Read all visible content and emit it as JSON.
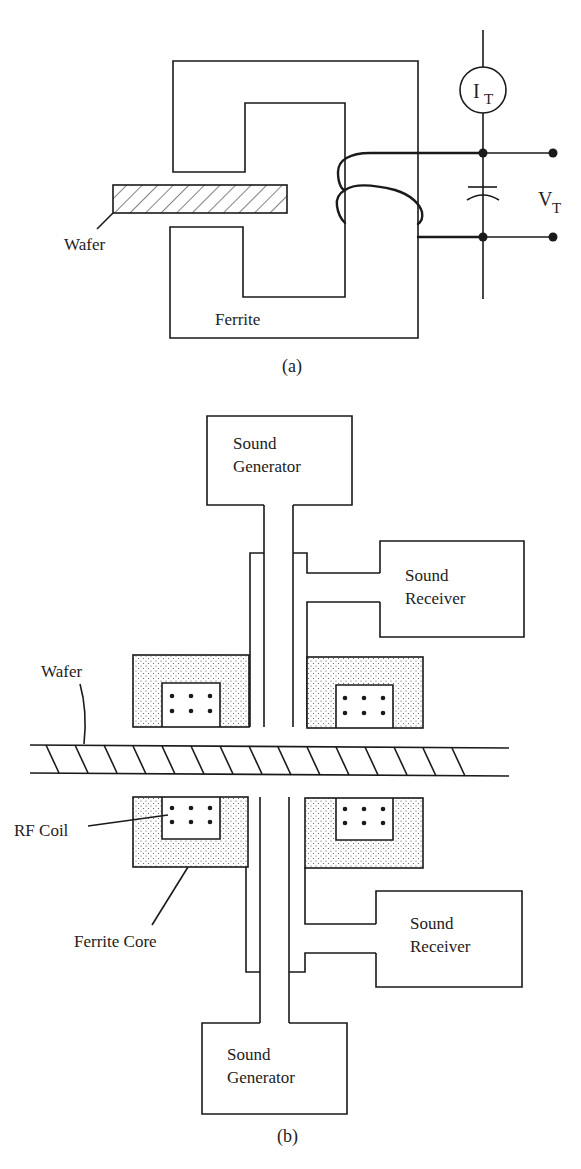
{
  "figure": {
    "panel_a": {
      "caption": "(a)",
      "labels": {
        "wafer": "Wafer",
        "ferrite": "Ferrite",
        "current_meter_main": "I",
        "current_meter_sub": "T",
        "voltage_main": "V",
        "voltage_sub": "T"
      },
      "components": [
        "ferrite-core",
        "wafer",
        "coil",
        "current-meter",
        "capacitor",
        "voltage-terminals"
      ]
    },
    "panel_b": {
      "caption": "(b)",
      "labels": {
        "sound_generator_top_line1": "Sound",
        "sound_generator_top_line2": "Generator",
        "sound_receiver_top_line1": "Sound",
        "sound_receiver_top_line2": "Receiver",
        "wafer": "Wafer",
        "rf_coil": "RF Coil",
        "ferrite_core": "Ferrite Core",
        "sound_receiver_bottom_line1": "Sound",
        "sound_receiver_bottom_line2": "Receiver",
        "sound_generator_bottom_line1": "Sound",
        "sound_generator_bottom_line2": "Generator"
      },
      "coil_dot_grid": {
        "rows": 2,
        "cols": 3
      }
    },
    "colors": {
      "line": "#1a1a1a",
      "background": "#ffffff",
      "ferrite_stipple": "#555555"
    }
  }
}
